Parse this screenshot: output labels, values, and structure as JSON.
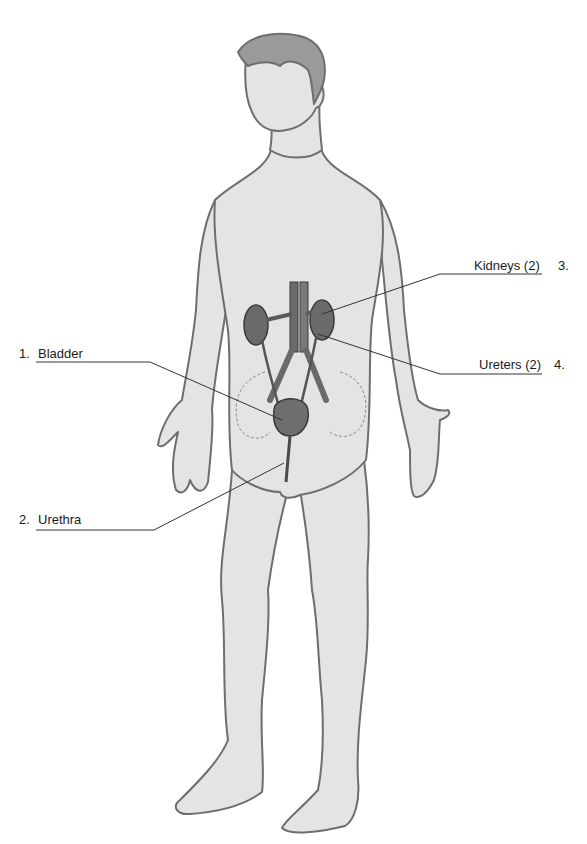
{
  "figure": {
    "colors": {
      "skin": "#e4e4e4",
      "outline": "#6e6e6e",
      "hair": "#9a9a9a",
      "organ": "#6a6a6a",
      "organ_dark": "#4a4a4a",
      "leader_line": "#333333",
      "background": "#ffffff"
    }
  },
  "labels": [
    {
      "number": "1.",
      "text": "Bladder",
      "side": "left"
    },
    {
      "number": "2.",
      "text": "Urethra",
      "side": "left"
    },
    {
      "number": "3.",
      "text": "Kidneys (2)",
      "side": "right"
    },
    {
      "number": "4.",
      "text": "Ureters (2)",
      "side": "right"
    }
  ]
}
